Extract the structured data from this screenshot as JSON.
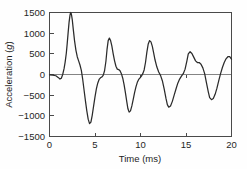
{
  "chart_data": {
    "type": "line",
    "title": "",
    "xlabel": "Time (ms)",
    "ylabel": "Acceleration (g)",
    "ylabel_plain": "Acceleration (",
    "ylabel_unit": "g",
    "ylabel_close": ")",
    "xlim": [
      0,
      20
    ],
    "ylim": [
      -1500,
      1500
    ],
    "grid": false,
    "legend": null,
    "xticks": [
      0,
      5,
      10,
      15,
      20
    ],
    "xtick_labels": [
      "0",
      "5",
      "10",
      "15",
      "20"
    ],
    "yticks": [
      1500,
      1000,
      500,
      0,
      -500,
      -1000,
      -1500
    ],
    "ytick_labels": [
      "1500",
      "1000",
      "500",
      "0",
      "−500",
      "−1000",
      "−1500"
    ],
    "line_color": "#2b2b2b",
    "zero_line_color": "#777777",
    "axis_color": "#4a4a4a",
    "background_color": "#fefefe",
    "series": [
      {
        "name": "Acceleration",
        "x": [
          0.0,
          0.35,
          0.7,
          0.95,
          1.15,
          1.3,
          1.45,
          1.6,
          1.72,
          1.85,
          1.95,
          2.05,
          2.15,
          2.25,
          2.32,
          2.4,
          2.5,
          2.62,
          2.75,
          2.9,
          3.05,
          3.2,
          3.35,
          3.5,
          3.65,
          3.8,
          3.95,
          4.1,
          4.25,
          4.4,
          4.55,
          4.7,
          4.85,
          5.0,
          5.15,
          5.3,
          5.45,
          5.6,
          5.75,
          5.9,
          6.05,
          6.2,
          6.32,
          6.45,
          6.58,
          6.7,
          6.85,
          7.0,
          7.15,
          7.3,
          7.45,
          7.6,
          7.75,
          7.9,
          8.05,
          8.2,
          8.35,
          8.5,
          8.62,
          8.75,
          8.9,
          9.05,
          9.2,
          9.35,
          9.5,
          9.65,
          9.8,
          9.95,
          10.1,
          10.25,
          10.4,
          10.55,
          10.7,
          10.85,
          11.0,
          11.15,
          11.3,
          11.45,
          11.6,
          11.8,
          12.0,
          12.2,
          12.4,
          12.6,
          12.8,
          12.95,
          13.1,
          13.3,
          13.5,
          13.7,
          13.9,
          14.1,
          14.3,
          14.5,
          14.7,
          14.9,
          15.1,
          15.25,
          15.45,
          15.65,
          15.85,
          16.05,
          16.25,
          16.45,
          16.65,
          16.85,
          17.05,
          17.25,
          17.45,
          17.6,
          17.8,
          18.0,
          18.2,
          18.4,
          18.6,
          18.8,
          19.0,
          19.2,
          19.4,
          19.6,
          19.8,
          20.0
        ],
        "y": [
          -10,
          -15,
          -30,
          -70,
          -110,
          -90,
          0,
          140,
          300,
          520,
          760,
          1020,
          1260,
          1430,
          1500,
          1470,
          1330,
          1080,
          820,
          590,
          430,
          330,
          230,
          100,
          -120,
          -380,
          -640,
          -880,
          -1080,
          -1190,
          -1150,
          -980,
          -760,
          -540,
          -350,
          -210,
          -120,
          -80,
          -60,
          -20,
          90,
          320,
          600,
          820,
          880,
          830,
          690,
          500,
          330,
          200,
          130,
          120,
          90,
          20,
          -90,
          -250,
          -450,
          -670,
          -830,
          -910,
          -880,
          -760,
          -600,
          -440,
          -300,
          -190,
          -120,
          -80,
          -40,
          20,
          110,
          290,
          540,
          740,
          820,
          790,
          680,
          520,
          350,
          180,
          60,
          -20,
          -150,
          -350,
          -580,
          -730,
          -790,
          -760,
          -650,
          -500,
          -350,
          -210,
          -110,
          -40,
          20,
          130,
          330,
          500,
          550,
          510,
          420,
          330,
          290,
          290,
          250,
          160,
          20,
          -200,
          -420,
          -560,
          -610,
          -580,
          -480,
          -330,
          -150,
          20,
          170,
          290,
          380,
          430,
          430,
          370
        ]
      }
    ]
  },
  "axes": {
    "y_title_prefix": "Acceleration (",
    "y_title_unit": "g",
    "y_title_suffix": ")",
    "x_title": "Time (ms)"
  }
}
